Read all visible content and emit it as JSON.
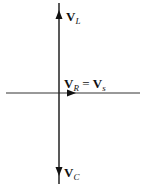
{
  "diagram": {
    "title": "",
    "type": "phasor-diagram",
    "colors": {
      "line": "#222222",
      "background": "#ffffff"
    },
    "axes": {
      "horizontal": {
        "from": [
          6,
          93
        ],
        "to": [
          140,
          93
        ]
      },
      "vertical": {
        "from": [
          59,
          3
        ],
        "to": [
          59,
          184
        ]
      }
    },
    "phasors": [
      {
        "id": "VL",
        "direction": "up",
        "symbol": "V",
        "subscript": "L"
      },
      {
        "id": "VR",
        "direction": "right",
        "symbol": "V",
        "subscript": "R",
        "equals": "= V",
        "equals_subscript": "s"
      },
      {
        "id": "VC",
        "direction": "down",
        "symbol": "V",
        "subscript": "C"
      }
    ]
  }
}
